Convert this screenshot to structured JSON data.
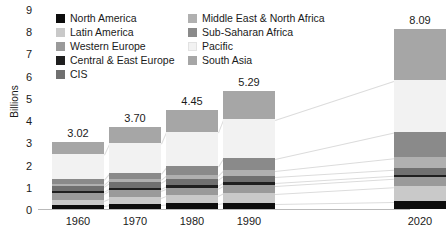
{
  "chart_data": {
    "type": "bar",
    "subtype": "stacked-bar",
    "title": "",
    "xlabel": "",
    "ylabel": "Billions",
    "ylim": [
      0,
      9
    ],
    "yticks": [
      "0",
      "1",
      "2",
      "3",
      "4",
      "5",
      "6",
      "7",
      "8",
      "9"
    ],
    "grid": false,
    "legend_position": "top-inside",
    "categories": [
      "1960",
      "1970",
      "1980",
      "1990",
      "2020"
    ],
    "totals": [
      "3.02",
      "3.70",
      "4.45",
      "5.29",
      "8.09"
    ],
    "series": [
      {
        "name": "North America",
        "color": "#0d0d0d",
        "values": [
          0.2,
          0.23,
          0.25,
          0.28,
          0.37
        ]
      },
      {
        "name": "Latin America",
        "color": "#c9c9c9",
        "values": [
          0.22,
          0.29,
          0.36,
          0.44,
          0.65
        ]
      },
      {
        "name": "Western Europe",
        "color": "#9a9a9a",
        "values": [
          0.31,
          0.34,
          0.35,
          0.37,
          0.4
        ]
      },
      {
        "name": "Central & East Europe",
        "color": "#1f1f1f",
        "values": [
          0.09,
          0.1,
          0.11,
          0.12,
          0.12
        ]
      },
      {
        "name": "CIS",
        "color": "#707070",
        "values": [
          0.21,
          0.24,
          0.27,
          0.29,
          0.29
        ]
      },
      {
        "name": "Middle East & North Africa",
        "color": "#b0b0b0",
        "values": [
          0.11,
          0.15,
          0.2,
          0.27,
          0.51
        ]
      },
      {
        "name": "Sub-Saharan Africa",
        "color": "#8a8a8a",
        "values": [
          0.23,
          0.29,
          0.38,
          0.51,
          1.13
        ]
      },
      {
        "name": "Pacific",
        "color": "#f2f2f2",
        "values": [
          1.1,
          1.31,
          1.55,
          1.77,
          2.34
        ]
      },
      {
        "name": "South Asia",
        "color": "#a6a6a6",
        "values": [
          0.55,
          0.75,
          0.98,
          1.24,
          2.28
        ]
      }
    ]
  },
  "legend": {
    "items": [
      {
        "label": "North America"
      },
      {
        "label": "Latin America"
      },
      {
        "label": "Western Europe"
      },
      {
        "label": "Central & East Europe"
      },
      {
        "label": "CIS"
      },
      {
        "label": "Middle East & North Africa"
      },
      {
        "label": "Sub-Saharan Africa"
      },
      {
        "label": "Pacific"
      },
      {
        "label": "South Asia"
      }
    ]
  }
}
